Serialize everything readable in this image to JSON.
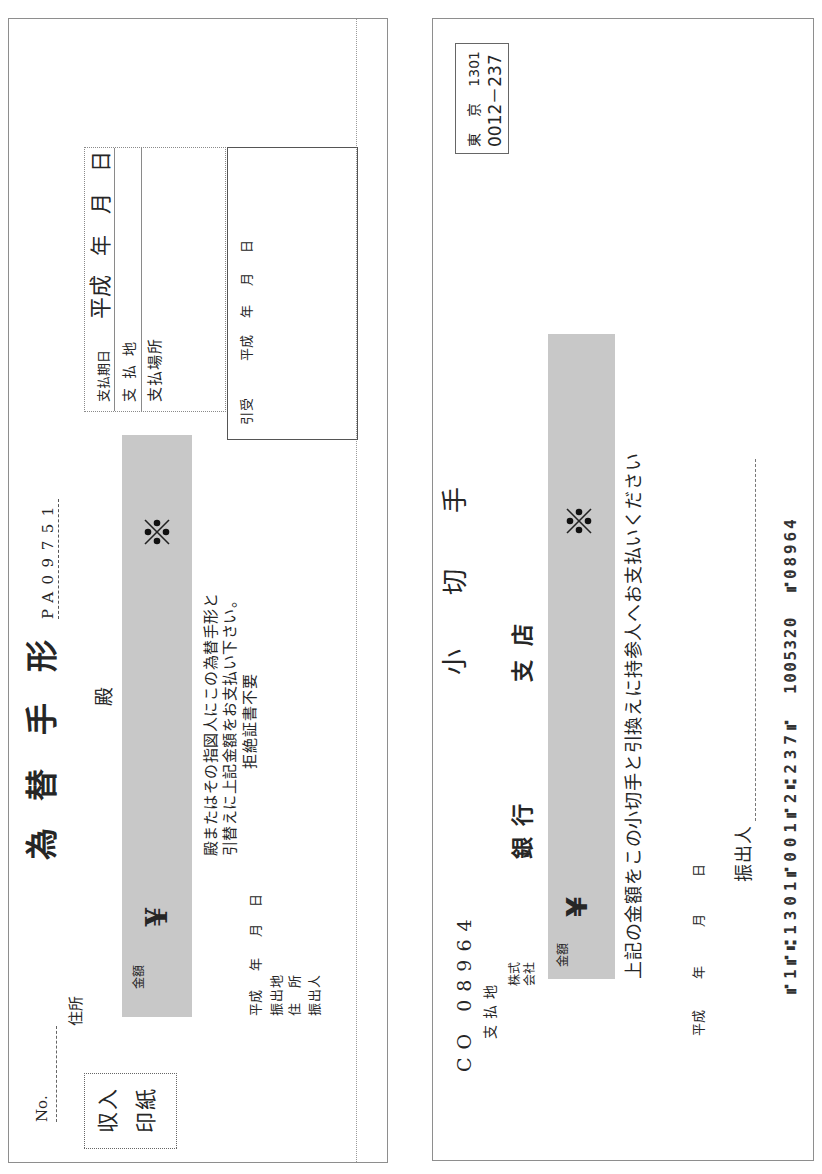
{
  "bill": {
    "title": [
      "為",
      "替",
      "手",
      "形"
    ],
    "serial": "PA09751",
    "no_label": "No.",
    "address_label": "住所",
    "honorific": "殿",
    "stamp": [
      "収入",
      "印紙"
    ],
    "amount": {
      "label": "金額",
      "currency": "¥",
      "mark_icon": "reference-mark"
    },
    "instructions": [
      "殿またはその指図人にこの為替手形と",
      "引替えに上記金額をお支払い下さい。",
      "拒絶証書不要"
    ],
    "issue_date": {
      "era": "平成",
      "year": "年",
      "month": "月",
      "day": "日"
    },
    "issuer_fields": [
      "振出地",
      "住　所",
      "振出人"
    ],
    "payment": {
      "due_label": "支払期日",
      "due_date": {
        "era": "平成",
        "year": "年",
        "month": "月",
        "day": "日"
      },
      "place_label": "支払地",
      "location_label": "支払場所"
    },
    "acceptance": {
      "label": "引受",
      "date": {
        "era": "平成",
        "year": "年",
        "month": "月",
        "day": "日"
      }
    }
  },
  "check": {
    "title": [
      "小",
      "切",
      "手"
    ],
    "clearing": {
      "city": [
        "東",
        "京"
      ],
      "house_no": "1301",
      "bank_branch": "0012－237"
    },
    "check_no": "CO 08964",
    "pay_place_label": "支払地",
    "company_label": [
      "株式",
      "会社"
    ],
    "bank_label": [
      "銀",
      "行"
    ],
    "branch_label": [
      "支",
      "店"
    ],
    "amount": {
      "label": "金額",
      "currency": "¥",
      "mark_icon": "reference-mark"
    },
    "instruction": "上記の金額をこの小切手と引換えに持参人へお支払いください",
    "issue_date": {
      "era": "平成",
      "year": "年",
      "month": "月",
      "day": "日"
    },
    "issuer_label": "振出人",
    "micr": [
      "⑈1⑈⑆1301⑈001⑈2⑆237⑈",
      "1005320",
      "⑈08964"
    ]
  },
  "colors": {
    "border": "#8e8e8e",
    "amount_band": "#c8c8c8",
    "text": "#262626"
  }
}
